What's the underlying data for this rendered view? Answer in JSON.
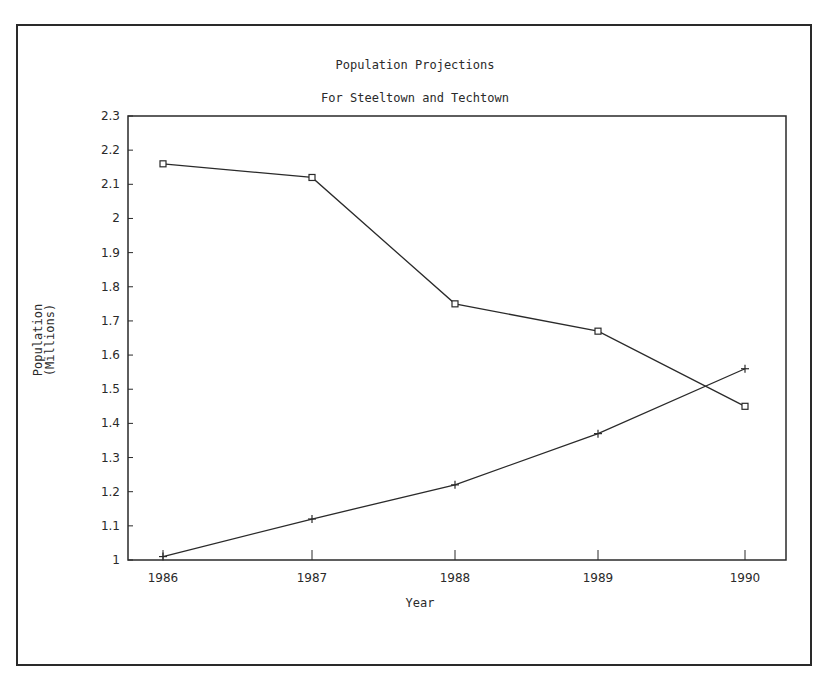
{
  "chart_data": {
    "type": "line",
    "title": "Population Projections",
    "subtitle": "For Steeltown and Techtown",
    "xlabel": "Year",
    "ylabel": "Population\n(Millions)",
    "categories": [
      "1986",
      "1987",
      "1988",
      "1989",
      "1990"
    ],
    "x": [
      1986,
      1987,
      1988,
      1989,
      1990
    ],
    "ylim": [
      1,
      2.3
    ],
    "yticks": [
      "1",
      "1.1",
      "1.2",
      "1.3",
      "1.4",
      "1.5",
      "1.6",
      "1.7",
      "1.8",
      "1.9",
      "2",
      "2.1",
      "2.2",
      "2.3"
    ],
    "grid": false,
    "legend": null,
    "series": [
      {
        "name": "Steeltown",
        "marker": "square",
        "values": [
          2.16,
          2.12,
          1.75,
          1.67,
          1.45
        ]
      },
      {
        "name": "Techtown",
        "marker": "plus",
        "values": [
          1.01,
          1.12,
          1.22,
          1.37,
          1.56
        ]
      }
    ]
  },
  "colors": {
    "line": "#2a2a2a",
    "background": "#ffffff"
  }
}
